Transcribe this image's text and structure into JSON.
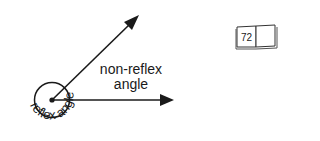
{
  "diagram": {
    "labels": {
      "non_reflex_line1": "non-reflex",
      "non_reflex_line2": "angle",
      "reflex": "reflex angle"
    },
    "colors": {
      "stroke": "#1a1a1a",
      "background": "#ffffff"
    }
  },
  "page_icon": {
    "icon": "open-book-icon",
    "page_number": "72"
  }
}
